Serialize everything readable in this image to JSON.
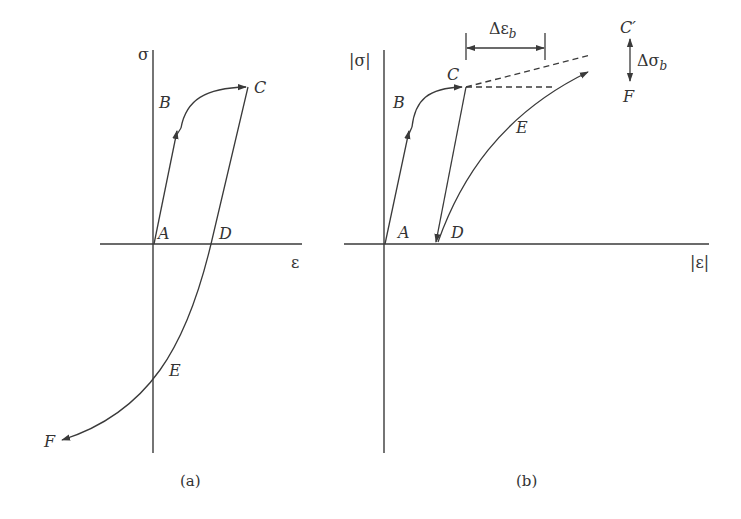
{
  "panel_a": {
    "caption": "(a)",
    "y_axis_label": "σ",
    "x_axis_label": "ε",
    "points": {
      "A": "A",
      "B": "B",
      "C": "C",
      "D": "D",
      "E": "E",
      "F": "F"
    }
  },
  "panel_b": {
    "caption": "(b)",
    "y_axis_label": "|σ|",
    "x_axis_label": "|ε|",
    "points": {
      "A": "A",
      "B": "B",
      "C": "C",
      "D": "D",
      "E": "E",
      "F": "F",
      "C_prime": "C′"
    },
    "delta_eps": "Δε",
    "delta_eps_sub": "b",
    "delta_sigma": "Δσ",
    "delta_sigma_sub": "b"
  },
  "colors": {
    "line": "#3a3a3a",
    "background": "#ffffff"
  }
}
